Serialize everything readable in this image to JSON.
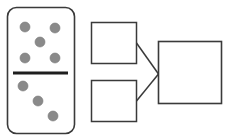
{
  "diagram": {
    "colors": {
      "stroke": "#3a3a3a",
      "dot": "#8a8a8a",
      "background": "#ffffff"
    },
    "domino": {
      "top_count": 5,
      "bottom_count": 3
    },
    "boxes": {
      "input_top": "",
      "input_bottom": "",
      "output": ""
    }
  }
}
